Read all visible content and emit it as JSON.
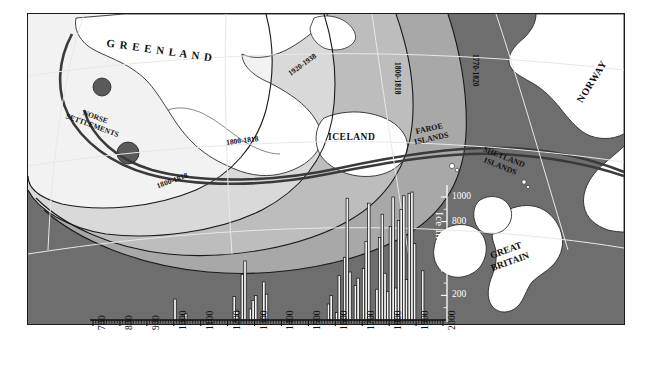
{
  "figure": {
    "kind": "map-with-inset-bar-chart",
    "background_color": "#ffffff",
    "ocean_color": "#6e6e6e",
    "land_color": "#ffffff",
    "ice_band_colors": [
      "#f2f2f2",
      "#d9d9d9",
      "#bdbdbd",
      "#a8a8a8"
    ],
    "frame_color": "#1a1a1a"
  },
  "map": {
    "place_labels": [
      {
        "name": "greenland",
        "text": "G R E E N L A N D"
      },
      {
        "name": "norse-settlements-line1",
        "text": "NORSE"
      },
      {
        "name": "norse-settlements-line2",
        "text": "SETTLEMENTS"
      },
      {
        "name": "iceland",
        "text": "ICELAND"
      },
      {
        "name": "faroe-islands-line1",
        "text": "FAROE"
      },
      {
        "name": "faroe-islands-line2",
        "text": "ISLANDS"
      },
      {
        "name": "shetland-islands-line1",
        "text": "SHETLAND"
      },
      {
        "name": "shetland-islands-line2",
        "text": "ISLANDS"
      },
      {
        "name": "norway",
        "text": "NORWAY"
      },
      {
        "name": "great-britain-line1",
        "text": "GREAT"
      },
      {
        "name": "great-britain-line2",
        "text": "BRITAIN"
      }
    ],
    "ice_limit_labels": [
      {
        "name": "ice-limit-1920-1938",
        "text": "1920-1938"
      },
      {
        "name": "ice-limit-1800-1818-iceland",
        "text": "1800-1818"
      },
      {
        "name": "ice-limit-1770-1820",
        "text": "1770-1820"
      },
      {
        "name": "ice-limit-1800-1818-central",
        "text": "1800-1818"
      },
      {
        "name": "ice-limit-1800-1818-south",
        "text": "1800-1818"
      }
    ]
  },
  "chart_data": {
    "type": "bar",
    "title": "",
    "xlabel": "Years A.D.",
    "ylabel": "Ice Index",
    "xlim": [
      700,
      2000
    ],
    "ylim": [
      0,
      1100
    ],
    "xticks": [
      700,
      800,
      900,
      1000,
      1100,
      1200,
      1300,
      1400,
      1500,
      1600,
      1700,
      1800,
      1900,
      2000
    ],
    "xtick_labels": [
      "700",
      "800",
      "900",
      "1000",
      "1100",
      "1200",
      "1300",
      "1400",
      "1500",
      "1600",
      "1700",
      "1800",
      "1900",
      "2000"
    ],
    "xminor_step": 10,
    "yticks": [
      200,
      400,
      600,
      800,
      1000
    ],
    "ytick_labels": [
      "200",
      "400",
      "600",
      "800",
      "1000"
    ],
    "grid": false,
    "bar_color": "#f2f2f2",
    "bar_edge_color": "#111111",
    "bin_width_years": 10,
    "x": [
      700,
      710,
      720,
      730,
      740,
      750,
      760,
      770,
      780,
      790,
      800,
      810,
      820,
      830,
      840,
      850,
      860,
      870,
      880,
      890,
      900,
      910,
      920,
      930,
      940,
      950,
      960,
      970,
      980,
      990,
      1000,
      1010,
      1020,
      1030,
      1040,
      1050,
      1060,
      1070,
      1080,
      1090,
      1100,
      1110,
      1120,
      1130,
      1140,
      1150,
      1160,
      1170,
      1180,
      1190,
      1200,
      1210,
      1220,
      1230,
      1240,
      1250,
      1260,
      1270,
      1280,
      1290,
      1300,
      1310,
      1320,
      1330,
      1340,
      1350,
      1360,
      1370,
      1380,
      1390,
      1400,
      1410,
      1420,
      1430,
      1440,
      1450,
      1460,
      1470,
      1480,
      1490,
      1500,
      1510,
      1520,
      1530,
      1540,
      1550,
      1560,
      1570,
      1580,
      1590,
      1600,
      1610,
      1620,
      1630,
      1640,
      1650,
      1660,
      1670,
      1680,
      1690,
      1700,
      1710,
      1720,
      1730,
      1740,
      1750,
      1760,
      1770,
      1780,
      1790,
      1800,
      1810,
      1820,
      1830,
      1840,
      1850,
      1860,
      1870,
      1880,
      1890,
      1900,
      1910,
      1920,
      1930,
      1940,
      1950,
      1960,
      1970,
      1980,
      1990
    ],
    "values": [
      0,
      0,
      0,
      0,
      0,
      0,
      0,
      0,
      0,
      0,
      0,
      0,
      0,
      0,
      0,
      0,
      0,
      0,
      0,
      0,
      0,
      0,
      0,
      0,
      0,
      0,
      0,
      0,
      0,
      0,
      170,
      0,
      0,
      0,
      50,
      0,
      0,
      0,
      0,
      0,
      0,
      0,
      0,
      0,
      0,
      0,
      0,
      0,
      0,
      0,
      0,
      0,
      190,
      80,
      0,
      370,
      480,
      0,
      90,
      160,
      200,
      0,
      0,
      310,
      210,
      0,
      0,
      0,
      0,
      0,
      0,
      0,
      0,
      0,
      0,
      0,
      0,
      0,
      0,
      0,
      0,
      0,
      0,
      0,
      0,
      0,
      0,
      130,
      200,
      0,
      60,
      360,
      0,
      510,
      990,
      390,
      0,
      280,
      340,
      0,
      420,
      640,
      950,
      0,
      0,
      250,
      670,
      860,
      380,
      230,
      760,
      1000,
      260,
      810,
      900,
      1010,
      330,
      1030,
      1040,
      620,
      0,
      0,
      400,
      0,
      0,
      0,
      0,
      0,
      0,
      0
    ]
  },
  "axes": {
    "xaxis_title": "Years A.D.",
    "yaxis_title": "Ice Index"
  }
}
